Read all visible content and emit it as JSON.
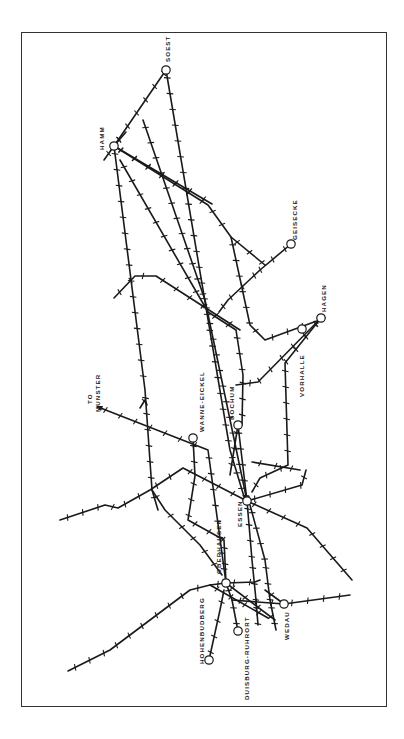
{
  "map": {
    "colors": {
      "line": "#1a1a1a",
      "frame": "#333333",
      "background": "#ffffff"
    },
    "orientation": "rotated 90deg clockwise (labels read bottom-to-top)",
    "stations": [
      {
        "id": "soest",
        "label": "SOEST",
        "x": 166,
        "y": 70,
        "label_x": 170,
        "label_y": 62
      },
      {
        "id": "hamm",
        "label": "HAMM",
        "x": 114,
        "y": 146,
        "label_x": 104,
        "label_y": 150
      },
      {
        "id": "geisecke",
        "label": "GEISECKE",
        "x": 291,
        "y": 244,
        "label_x": 297,
        "label_y": 240
      },
      {
        "id": "hagen",
        "label": "HAGEN",
        "x": 321,
        "y": 318,
        "label_x": 326,
        "label_y": 312
      },
      {
        "id": "vorhalle",
        "label": "VORHALLE",
        "x": 302,
        "y": 329,
        "label_x": 304,
        "label_y": 397
      },
      {
        "id": "bochum",
        "label": "BOCHUM",
        "x": 238,
        "y": 425,
        "label_x": 234,
        "label_y": 420
      },
      {
        "id": "wanne-eickel",
        "label": "WANNE-EICKEL",
        "x": 193,
        "y": 438,
        "label_x": 204,
        "label_y": 432
      },
      {
        "id": "essen",
        "label": "ESSEN",
        "x": 247,
        "y": 501,
        "label_x": 242,
        "label_y": 527
      },
      {
        "id": "oberhausen",
        "label": "OBERHAUSEN",
        "x": 226,
        "y": 583,
        "label_x": 221,
        "label_y": 574
      },
      {
        "id": "wedau",
        "label": "WEDAU",
        "x": 284,
        "y": 604,
        "label_x": 289,
        "label_y": 640
      },
      {
        "id": "duisburg-ruhrort",
        "label": "DUISBURG-RUHRORT",
        "x": 238,
        "y": 631,
        "label_x": 249,
        "label_y": 700
      },
      {
        "id": "hohenbudberg",
        "label": "HOHENBUDBERG",
        "x": 209,
        "y": 660,
        "label_x": 204,
        "label_y": 664
      }
    ],
    "annotations": [
      {
        "id": "to-munster",
        "lines": [
          "TO",
          "MUNSTER"
        ],
        "x": 92,
        "y": 412
      }
    ],
    "routes": [
      {
        "name": "hamm-soest-a",
        "points": [
          [
            114,
            146
          ],
          [
            166,
            70
          ]
        ]
      },
      {
        "name": "soest-south",
        "points": [
          [
            166,
            70
          ],
          [
            230,
            450
          ],
          [
            245,
            500
          ]
        ]
      },
      {
        "name": "soest-diag",
        "points": [
          [
            143,
            120
          ],
          [
            205,
            300
          ],
          [
            247,
            501
          ]
        ]
      },
      {
        "name": "hamm-north-spur",
        "points": [
          [
            104,
            160
          ],
          [
            114,
            146
          ],
          [
            126,
            132
          ]
        ]
      },
      {
        "name": "hamm-hagen-main",
        "points": [
          [
            114,
            146
          ],
          [
            208,
            205
          ],
          [
            231,
            237
          ],
          [
            250,
            325
          ],
          [
            265,
            340
          ],
          [
            325,
            318
          ]
        ]
      },
      {
        "name": "hamm-east",
        "points": [
          [
            114,
            146
          ],
          [
            212,
            204
          ]
        ]
      },
      {
        "name": "hamm-branch-a",
        "points": [
          [
            114,
            146
          ],
          [
            145,
            390
          ],
          [
            152,
            490
          ],
          [
            158,
            510
          ]
        ]
      },
      {
        "name": "hamm-branch-b",
        "points": [
          [
            120,
            160
          ],
          [
            208,
            312
          ],
          [
            236,
            330
          ],
          [
            243,
            375
          ],
          [
            242,
            425
          ]
        ]
      },
      {
        "name": "geisecke-line",
        "points": [
          [
            291,
            244
          ],
          [
            260,
            270
          ],
          [
            228,
            300
          ],
          [
            219,
            312
          ]
        ]
      },
      {
        "name": "geisecke-north",
        "points": [
          [
            231,
            237
          ],
          [
            265,
            265
          ]
        ]
      },
      {
        "name": "dortmund-west",
        "points": [
          [
            114,
            298
          ],
          [
            135,
            276
          ],
          [
            156,
            276
          ],
          [
            240,
            330
          ]
        ]
      },
      {
        "name": "vorhalle-a",
        "points": [
          [
            321,
            318
          ],
          [
            258,
            382
          ],
          [
            236,
            385
          ]
        ]
      },
      {
        "name": "vorhalle-b",
        "points": [
          [
            321,
            318
          ],
          [
            285,
            363
          ],
          [
            288,
            465
          ],
          [
            260,
            478
          ],
          [
            252,
            492
          ]
        ]
      },
      {
        "name": "munster",
        "points": [
          [
            98,
            407
          ],
          [
            208,
            450
          ],
          [
            226,
            583
          ]
        ]
      },
      {
        "name": "munster-tri",
        "points": [
          [
            140,
            408
          ],
          [
            145,
            400
          ],
          [
            147,
            405
          ]
        ]
      },
      {
        "name": "wanne-south",
        "points": [
          [
            193,
            438
          ],
          [
            195,
            476
          ],
          [
            188,
            520
          ],
          [
            224,
            540
          ],
          [
            226,
            583
          ]
        ]
      },
      {
        "name": "essen-bochum",
        "points": [
          [
            238,
            425
          ],
          [
            247,
            501
          ]
        ]
      },
      {
        "name": "bochum-south-a",
        "points": [
          [
            238,
            425
          ],
          [
            230,
            475
          ]
        ]
      },
      {
        "name": "essen-rail-east",
        "points": [
          [
            247,
            501
          ],
          [
            302,
            485
          ],
          [
            306,
            470
          ]
        ]
      },
      {
        "name": "essen-ne",
        "points": [
          [
            252,
            462
          ],
          [
            300,
            470
          ]
        ]
      },
      {
        "name": "essen-se",
        "points": [
          [
            247,
            501
          ],
          [
            307,
            528
          ],
          [
            352,
            580
          ]
        ]
      },
      {
        "name": "west-long",
        "points": [
          [
            60,
            520
          ],
          [
            105,
            505
          ],
          [
            118,
            508
          ],
          [
            150,
            490
          ],
          [
            183,
            468
          ],
          [
            247,
            501
          ]
        ]
      },
      {
        "name": "west-mid",
        "points": [
          [
            152,
            490
          ],
          [
            165,
            510
          ],
          [
            200,
            545
          ],
          [
            222,
            575
          ]
        ]
      },
      {
        "name": "essen-south-a",
        "points": [
          [
            247,
            501
          ],
          [
            252,
            560
          ],
          [
            256,
            600
          ],
          [
            258,
            625
          ]
        ]
      },
      {
        "name": "essen-south-b",
        "points": [
          [
            250,
            505
          ],
          [
            265,
            560
          ],
          [
            270,
            600
          ],
          [
            276,
            630
          ]
        ]
      },
      {
        "name": "oberhausen-cross",
        "points": [
          [
            226,
            583
          ],
          [
            255,
            582
          ],
          [
            260,
            580
          ]
        ]
      },
      {
        "name": "wedau-east",
        "points": [
          [
            232,
            600
          ],
          [
            284,
            604
          ],
          [
            350,
            595
          ]
        ]
      },
      {
        "name": "oberhausen-wedau",
        "points": [
          [
            226,
            583
          ],
          [
            275,
            620
          ]
        ]
      },
      {
        "name": "ruhrort",
        "points": [
          [
            226,
            583
          ],
          [
            232,
            600
          ],
          [
            238,
            631
          ]
        ]
      },
      {
        "name": "hohenbudberg",
        "points": [
          [
            209,
            660
          ],
          [
            220,
            610
          ],
          [
            224,
            590
          ]
        ]
      },
      {
        "name": "west-southwest",
        "points": [
          [
            68,
            671
          ],
          [
            110,
            650
          ],
          [
            150,
            620
          ],
          [
            190,
            590
          ],
          [
            210,
            585
          ],
          [
            226,
            583
          ]
        ]
      },
      {
        "name": "wedau-feed",
        "points": [
          [
            265,
            590
          ],
          [
            284,
            604
          ]
        ]
      },
      {
        "name": "oberhausen-south-diag",
        "points": [
          [
            210,
            585
          ],
          [
            268,
            618
          ]
        ]
      }
    ]
  }
}
